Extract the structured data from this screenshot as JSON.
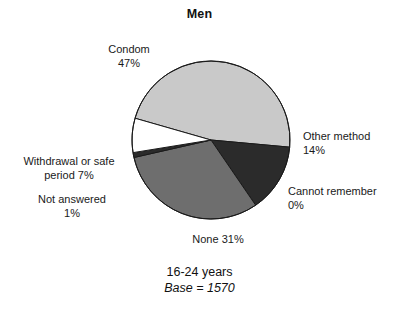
{
  "chart_data": {
    "type": "pie",
    "title": "Men",
    "subtitle_age": "16-24 years",
    "subtitle_base": "Base = 1570",
    "base_n": 1570,
    "categories": [
      "Condom",
      "Other method",
      "Cannot remember",
      "None",
      "Not answered",
      "Withdrawal or safe period"
    ],
    "values": [
      47,
      14,
      0,
      31,
      1,
      7
    ],
    "unit": "%",
    "legend": "none",
    "grid": false,
    "slices": [
      {
        "name": "Condom",
        "value": 47,
        "value_text": "47%",
        "label_name": "Condom",
        "label_value": "47%",
        "color": "#c9c9c9",
        "start_angle": 196,
        "end_angle": 365.2
      },
      {
        "name": "Other method",
        "value": 14,
        "value_text": "14%",
        "label_name": "Other method",
        "label_value": "14%",
        "color": "#2b2b2b",
        "start_angle": 365.2,
        "end_angle": 415.6
      },
      {
        "name": "Cannot remember",
        "value": 0,
        "value_text": "0%",
        "label_name": "Cannot remember",
        "label_value": "0%",
        "color": "#2b2b2b",
        "start_angle": 415.6,
        "end_angle": 415.6
      },
      {
        "name": "None",
        "value": 31,
        "value_text": "31%",
        "label_name": "None",
        "label_value": "31%",
        "color": "#6e6e6e",
        "start_angle": 415.6,
        "end_angle": 527.2
      },
      {
        "name": "Not answered",
        "value": 1,
        "value_text": "1%",
        "label_name": "Not answered",
        "label_value": "1%",
        "color": "#2b2b2b",
        "start_angle": 527.2,
        "end_angle": 530.8
      },
      {
        "name": "Withdrawal or safe period",
        "value": 7,
        "value_text": "7%",
        "label_name": "Withdrawal or safe",
        "label_value": "period 7%",
        "color": "#ffffff",
        "start_angle": 530.8,
        "end_angle": 556.0
      }
    ],
    "geometry": {
      "cx": 211,
      "cy": 140,
      "r": 79
    },
    "colors": {
      "outline": "#1a1a1a",
      "background": "#ffffff",
      "text": "#1a1a1a"
    }
  }
}
